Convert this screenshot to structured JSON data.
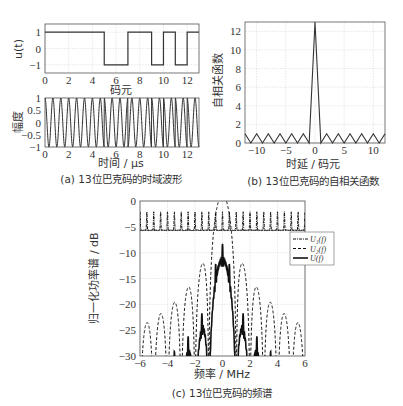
{
  "chart_data": [
    {
      "id": "a_top",
      "type": "line",
      "title": "",
      "xlabel": "码元",
      "ylabel": "u(t)",
      "xlim": [
        0,
        13
      ],
      "ylim": [
        -1.5,
        1.5
      ],
      "xticks": [
        0,
        2,
        4,
        6,
        8,
        10,
        12
      ],
      "yticks": [
        -1,
        0,
        1
      ],
      "grid": true,
      "series": [
        {
          "name": "u(t)",
          "style": "step",
          "x": [
            0,
            1,
            2,
            3,
            4,
            5,
            6,
            7,
            8,
            9,
            10,
            11,
            12,
            13
          ],
          "values": [
            1,
            1,
            1,
            1,
            1,
            -1,
            -1,
            1,
            1,
            -1,
            1,
            -1,
            1
          ]
        }
      ]
    },
    {
      "id": "a_bottom",
      "type": "line",
      "xlabel": "时间 / μs",
      "ylabel": "幅度",
      "xlim": [
        0,
        13
      ],
      "ylim": [
        -1,
        1
      ],
      "xticks": [
        0,
        2,
        4,
        6,
        8,
        10,
        12
      ],
      "yticks": [
        -1,
        -0.5,
        0,
        0.5,
        1
      ],
      "grid": true,
      "series": [
        {
          "name": "BPSK carrier",
          "style": "sine",
          "cycles_per_chip": 1.5,
          "chips": [
            1,
            1,
            1,
            1,
            1,
            -1,
            -1,
            1,
            1,
            -1,
            1,
            -1,
            1
          ]
        }
      ]
    },
    {
      "id": "b",
      "type": "line",
      "caption": "(b) 13位巴克码的自相关函数",
      "xlabel": "时延 / 码元",
      "ylabel": "自相关函数",
      "xlim": [
        -12,
        12
      ],
      "ylim": [
        0,
        13
      ],
      "xticks": [
        -10,
        -5,
        0,
        5,
        10
      ],
      "yticks": [
        0,
        2,
        4,
        6,
        8,
        10,
        12
      ],
      "grid": true,
      "series": [
        {
          "name": "autocorrelation",
          "x": [
            -12,
            -11,
            -10,
            -9,
            -8,
            -7,
            -6,
            -5,
            -4,
            -3,
            -2,
            -1,
            0,
            1,
            2,
            3,
            4,
            5,
            6,
            7,
            8,
            9,
            10,
            11,
            12
          ],
          "values": [
            1,
            0,
            1,
            0,
            1,
            0,
            1,
            0,
            1,
            0,
            1,
            0,
            13,
            0,
            1,
            0,
            1,
            0,
            1,
            0,
            1,
            0,
            1,
            0,
            1
          ]
        }
      ]
    },
    {
      "id": "c",
      "type": "line",
      "caption": "(c) 13位巴克码的频谱",
      "xlabel": "频率 / MHz",
      "ylabel": "归一化功率谱 / dB",
      "xlim": [
        -6,
        6
      ],
      "ylim": [
        -30,
        0
      ],
      "xticks": [
        -6,
        -4,
        -2,
        0,
        2,
        4,
        6
      ],
      "yticks": [
        -30,
        -25,
        -20,
        -15,
        -10,
        -5,
        0
      ],
      "grid": true,
      "legend": {
        "position": "upper right",
        "entries": [
          "U₁(f)",
          "U₂(f)",
          "U(f)"
        ]
      },
      "series": [
        {
          "name": "U₁(f)",
          "style": "dash-dot",
          "description": "flat comb near -3 dB with spikes to 0 dB every 0.5 MHz"
        },
        {
          "name": "U₂(f)",
          "style": "dashed",
          "description": "sinc² envelope; main lobe peak 0 dB at 0 MHz, nulls at ±1, ±2, ... MHz"
        },
        {
          "name": "U(f)",
          "style": "solid",
          "lobe_centers": [
            -5.5,
            -4.5,
            -3.5,
            -2.5,
            -1.5,
            0,
            1.5,
            2.5,
            3.5,
            4.5,
            5.5
          ],
          "lobe_peaks_db": [
            -25,
            -23,
            -21,
            -18,
            -13.5,
            -3,
            -13.5,
            -18,
            -21,
            -23,
            -25
          ]
        }
      ]
    }
  ],
  "captions": {
    "a": "(a) 13位巴克码的时域波形",
    "b": "(b) 13位巴克码的自相关函数",
    "c": "(c) 13位巴克码的频谱"
  },
  "axes_text": {
    "a_top_ylabel": "u(t)",
    "a_top_xlabel": "码元",
    "a_bottom_ylabel": "幅度",
    "a_bottom_xlabel": "时间 / μs",
    "b_ylabel": "自相关函数",
    "b_xlabel": "时延 / 码元",
    "c_ylabel": "归一化功率谱 / dB",
    "c_xlabel": "频率 / MHz"
  },
  "legend": {
    "u1": "U₁(f)",
    "u2": "U₂(f)",
    "u": "U(f)"
  }
}
